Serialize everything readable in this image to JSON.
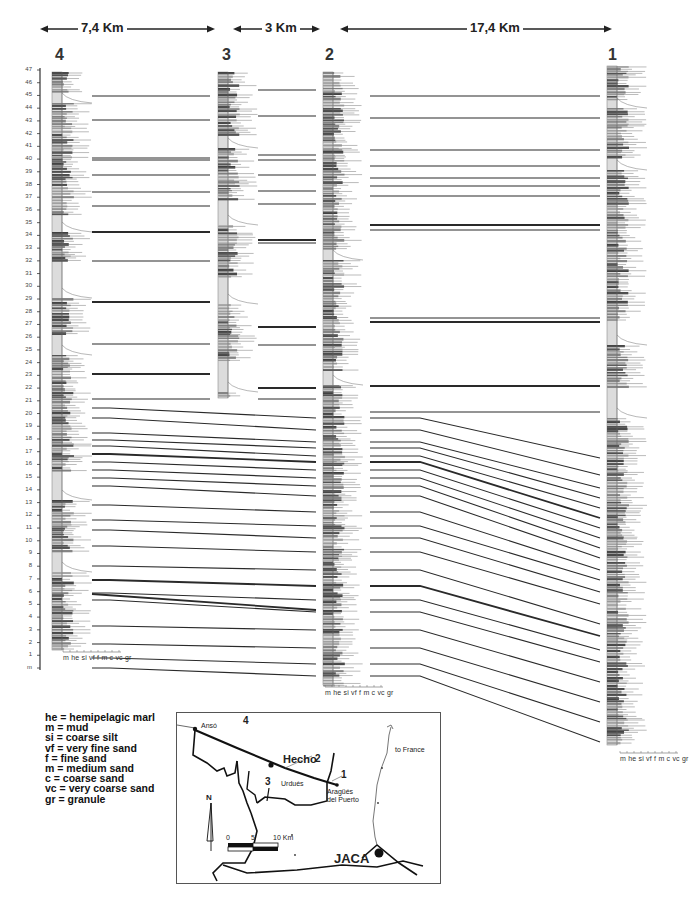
{
  "figure": {
    "distances": [
      {
        "label": "7,4 Km",
        "from_log": "4",
        "to_log": "3"
      },
      {
        "label": "3 Km",
        "from_log": "3",
        "to_log": "2"
      },
      {
        "label": "17,4 Km",
        "from_log": "2",
        "to_log": "1"
      }
    ],
    "logs": [
      {
        "id": "4",
        "label": "4"
      },
      {
        "id": "3",
        "label": "3"
      },
      {
        "id": "2",
        "label": "2"
      },
      {
        "id": "1",
        "label": "1"
      }
    ],
    "vertical_axis": {
      "ticks": [
        "47",
        "46",
        "45",
        "44",
        "43",
        "42",
        "41",
        "40",
        "39",
        "38",
        "37",
        "36",
        "35",
        "34",
        "33",
        "32",
        "31",
        "30",
        "29",
        "28",
        "27",
        "26",
        "25",
        "24",
        "23",
        "22",
        "21",
        "20",
        "19",
        "18",
        "17",
        "16",
        "15",
        "14",
        "13",
        "12",
        "11",
        "10",
        "9",
        "8",
        "7",
        "6",
        "5",
        "4",
        "3",
        "2",
        "1",
        "m"
      ]
    },
    "grain_size_scale": "m he si vf  f  m  c  vc gr",
    "legend": [
      "he = hemipelagic marl",
      "m = mud",
      "si = coarse silt",
      "vf = very fine sand",
      "f = fine sand",
      "m = medium sand",
      "c = coarse sand",
      "vc = very coarse sand",
      "gr = granule"
    ],
    "map": {
      "places": {
        "anso": "Ansó",
        "hecho": "Hecho",
        "urdues": "Urdués",
        "aragues": "Aragüés",
        "aragues2": "del Puerto",
        "jaca": "JACA",
        "france": "to France"
      },
      "site_numbers": {
        "s4": "4",
        "s3": "3",
        "s2": "2",
        "s1": "1"
      },
      "north": "N",
      "scale_bar": {
        "t0": "0",
        "t5": "5",
        "t10": "10 Km"
      }
    }
  },
  "colors": {
    "line": "#2a2a2a",
    "light_fill": "#dcdcdc",
    "mid_fill": "#8a8a8a",
    "dark_fill": "#3c3c3c"
  }
}
